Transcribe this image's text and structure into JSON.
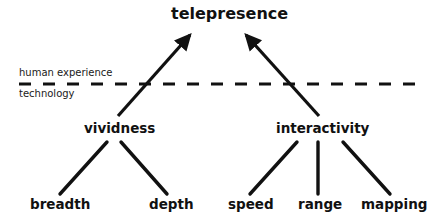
{
  "diagram": {
    "root": {
      "label": "telepresence"
    },
    "divider": {
      "upper_label": "human experience",
      "lower_label": "technology",
      "style": "dashed"
    },
    "branches": [
      {
        "label": "vividness",
        "children": [
          {
            "label": "breadth"
          },
          {
            "label": "depth"
          }
        ]
      },
      {
        "label": "interactivity",
        "children": [
          {
            "label": "speed"
          },
          {
            "label": "range"
          },
          {
            "label": "mapping"
          }
        ]
      }
    ],
    "edges": [
      {
        "from": "vividness",
        "to": "telepresence",
        "arrow": true
      },
      {
        "from": "interactivity",
        "to": "telepresence",
        "arrow": true
      },
      {
        "from": "vividness",
        "to": "breadth",
        "arrow": false
      },
      {
        "from": "vividness",
        "to": "depth",
        "arrow": false
      },
      {
        "from": "interactivity",
        "to": "speed",
        "arrow": false
      },
      {
        "from": "interactivity",
        "to": "range",
        "arrow": false
      },
      {
        "from": "interactivity",
        "to": "mapping",
        "arrow": false
      }
    ],
    "colors": {
      "ink": "#111111",
      "background": "#ffffff"
    }
  }
}
